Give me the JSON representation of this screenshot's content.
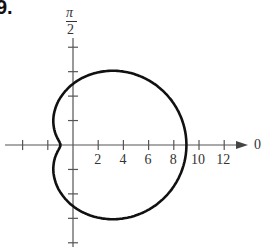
{
  "problem_number": "9.",
  "chart_data": {
    "type": "line",
    "subtype": "polar",
    "equation": "r = 5 + 4cos(theta)",
    "series": [
      {
        "name": "limacon",
        "r_at_0": 9,
        "r_at_pi_over_2": 5,
        "r_at_pi": 1
      }
    ],
    "polar_axis_label": "0",
    "vertical_axis_label": {
      "num": "π",
      "den": "2"
    },
    "tick_labels": [
      "2",
      "4",
      "6",
      "8",
      "10",
      "12"
    ],
    "xlim": [
      -5,
      14
    ],
    "ylim": [
      -8,
      8
    ],
    "grid": false
  }
}
